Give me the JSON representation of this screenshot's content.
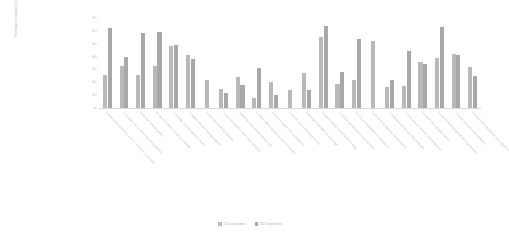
{
  "chart_data": {
    "type": "bar",
    "title": "",
    "xlabel": "",
    "ylabel": "Percentage of respondents (%)",
    "ylim": [
      0,
      70
    ],
    "yticks": [
      0,
      10,
      20,
      30,
      40,
      50,
      60,
      70
    ],
    "grid": false,
    "legend_position": "bottom",
    "categories": [
      "To understand customers, to drive innovation in business",
      "To increase internal efficiency and productivity",
      "To achieve revenue growth",
      "To improve product innovation and R&D",
      "To manage risk and regulatory issues",
      "To support decision making at speed",
      "To optimise marketing and sales",
      "To improve customer experience and loyalty",
      "To develop new products and services",
      "To reduce operating costs across the business",
      "To improve supply chain and logistics",
      "To identify new market opportunities",
      "To strengthen competitive advantage",
      "To support digital transformation strategy",
      "To improve workforce planning and talent",
      "To enhance fraud detection and security",
      "To personalise customer communication",
      "To automate manual business processes",
      "To build new partnerships and ecosystems",
      "To create new business models",
      "To improve forecasting and planning accuracy",
      "To attract and retain new customers",
      "To comply with new data privacy regulation"
    ],
    "series": [
      {
        "name": "2021 respondents",
        "values": [
          26,
          33,
          26,
          33,
          48,
          41,
          22,
          15,
          24,
          8,
          20,
          14,
          27,
          55,
          19,
          22,
          52,
          16,
          17,
          36,
          39,
          42,
          32
        ]
      },
      {
        "name": "2022 respondents",
        "values": [
          62,
          40,
          58,
          59,
          49,
          38,
          0,
          12,
          18,
          31,
          10,
          0,
          14,
          64,
          28,
          54,
          0,
          22,
          44,
          34,
          63,
          41,
          25
        ]
      }
    ],
    "colors": {
      "series_0": "#b9b9b9",
      "series_1": "#a8a8a8",
      "axis": "#d8d8d8",
      "text": "#b0b0b0",
      "background": "#ffffff"
    }
  }
}
